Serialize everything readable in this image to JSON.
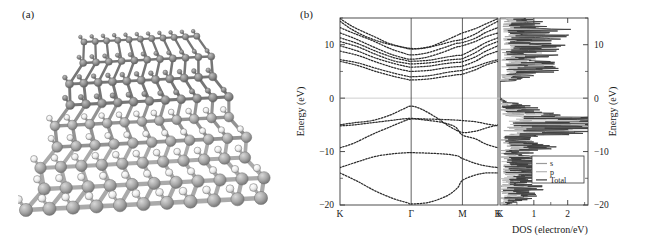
{
  "figure": {
    "panel_a_label": "(a)",
    "panel_b_label": "(b)",
    "panel_a_description": "ball-and-stick crystal lattice render"
  },
  "chart_data": {
    "type": "line",
    "title": "",
    "subtitle": "",
    "ylabel_left": "Energy (eV)",
    "ylabel_right": "Energy (eV)",
    "ylim": [
      -20,
      15
    ],
    "yticks": [
      10,
      0,
      -10,
      -20
    ],
    "ytick_labels": [
      "10",
      "0",
      "-10",
      "-20"
    ],
    "grid": false,
    "fermi_level": 0,
    "bandstructure": {
      "xlabel": "",
      "kpath_labels": [
        "K",
        "Γ",
        "M",
        "K"
      ],
      "kpath_positions": [
        0,
        1,
        1.72,
        2.22
      ],
      "series": [
        {
          "name": "cb1",
          "values": [
            [
              0,
              14.9
            ],
            [
              0.15,
              13.6
            ],
            [
              0.3,
              12.6
            ],
            [
              0.5,
              11.4
            ],
            [
              0.7,
              10.2
            ],
            [
              1.0,
              9.3
            ],
            [
              1.25,
              9.6
            ],
            [
              1.45,
              10.6
            ],
            [
              1.62,
              11.6
            ],
            [
              1.72,
              12.2
            ],
            [
              1.9,
              13.0
            ],
            [
              2.05,
              13.9
            ],
            [
              2.22,
              14.9
            ]
          ]
        },
        {
          "name": "cb2",
          "values": [
            [
              0,
              14.4
            ],
            [
              0.15,
              13.0
            ],
            [
              0.35,
              11.6
            ],
            [
              0.6,
              10.4
            ],
            [
              0.85,
              9.6
            ],
            [
              1.0,
              9.2
            ],
            [
              1.2,
              9.4
            ],
            [
              1.4,
              10.0
            ],
            [
              1.6,
              10.7
            ],
            [
              1.72,
              11.0
            ],
            [
              1.9,
              12.0
            ],
            [
              2.05,
              13.2
            ],
            [
              2.22,
              14.4
            ]
          ]
        },
        {
          "name": "cb3",
          "values": [
            [
              0,
              13.2
            ],
            [
              0.2,
              12.1
            ],
            [
              0.45,
              10.8
            ],
            [
              0.7,
              9.3
            ],
            [
              0.9,
              8.4
            ],
            [
              1.0,
              8.1
            ],
            [
              1.2,
              8.4
            ],
            [
              1.45,
              9.4
            ],
            [
              1.62,
              10.2
            ],
            [
              1.72,
              10.4
            ],
            [
              1.9,
              11.2
            ],
            [
              2.05,
              12.3
            ],
            [
              2.22,
              13.2
            ]
          ]
        },
        {
          "name": "cb4",
          "values": [
            [
              0,
              12.2
            ],
            [
              0.2,
              11.2
            ],
            [
              0.45,
              9.7
            ],
            [
              0.7,
              8.3
            ],
            [
              0.9,
              7.5
            ],
            [
              1.0,
              7.3
            ],
            [
              1.2,
              7.6
            ],
            [
              1.45,
              8.6
            ],
            [
              1.62,
              9.5
            ],
            [
              1.72,
              9.8
            ],
            [
              1.9,
              10.6
            ],
            [
              2.05,
              11.5
            ],
            [
              2.22,
              12.2
            ]
          ]
        },
        {
          "name": "cb5",
          "values": [
            [
              0,
              11.3
            ],
            [
              0.25,
              10.2
            ],
            [
              0.5,
              8.8
            ],
            [
              0.75,
              7.6
            ],
            [
              0.95,
              7.0
            ],
            [
              1.0,
              6.9
            ],
            [
              1.25,
              7.1
            ],
            [
              1.5,
              7.7
            ],
            [
              1.65,
              8.0
            ],
            [
              1.72,
              8.1
            ],
            [
              1.9,
              9.3
            ],
            [
              2.05,
              10.4
            ],
            [
              2.22,
              11.3
            ]
          ]
        },
        {
          "name": "cb6",
          "values": [
            [
              0,
              10.6
            ],
            [
              0.25,
              9.6
            ],
            [
              0.5,
              8.2
            ],
            [
              0.75,
              7.0
            ],
            [
              0.95,
              6.5
            ],
            [
              1.0,
              6.4
            ],
            [
              1.25,
              6.6
            ],
            [
              1.5,
              7.1
            ],
            [
              1.65,
              7.3
            ],
            [
              1.72,
              7.4
            ],
            [
              1.9,
              8.5
            ],
            [
              2.05,
              9.7
            ],
            [
              2.22,
              10.6
            ]
          ]
        },
        {
          "name": "cb7",
          "values": [
            [
              0,
              9.8
            ],
            [
              0.25,
              8.8
            ],
            [
              0.5,
              7.5
            ],
            [
              0.78,
              6.4
            ],
            [
              0.95,
              5.9
            ],
            [
              1.0,
              5.8
            ],
            [
              1.25,
              6.0
            ],
            [
              1.5,
              6.5
            ],
            [
              1.65,
              6.7
            ],
            [
              1.72,
              6.8
            ],
            [
              1.9,
              7.7
            ],
            [
              2.05,
              8.8
            ],
            [
              2.22,
              9.8
            ]
          ]
        },
        {
          "name": "cb8",
          "values": [
            [
              0,
              8.8
            ],
            [
              0.25,
              8.0
            ],
            [
              0.5,
              6.8
            ],
            [
              0.78,
              5.6
            ],
            [
              0.95,
              5.1
            ],
            [
              1.0,
              5.0
            ],
            [
              1.25,
              5.2
            ],
            [
              1.5,
              5.7
            ],
            [
              1.65,
              5.9
            ],
            [
              1.72,
              6.0
            ],
            [
              1.9,
              6.9
            ],
            [
              2.05,
              8.0
            ],
            [
              2.22,
              8.8
            ]
          ]
        },
        {
          "name": "cb9",
          "values": [
            [
              0,
              7.2
            ],
            [
              0.25,
              6.6
            ],
            [
              0.5,
              5.6
            ],
            [
              0.78,
              4.6
            ],
            [
              0.95,
              4.1
            ],
            [
              1.0,
              4.0
            ],
            [
              1.25,
              4.2
            ],
            [
              1.5,
              4.8
            ],
            [
              1.65,
              5.1
            ],
            [
              1.72,
              5.2
            ],
            [
              1.9,
              5.9
            ],
            [
              2.05,
              6.6
            ],
            [
              2.22,
              7.2
            ]
          ]
        },
        {
          "name": "cb10",
          "values": [
            [
              0,
              6.9
            ],
            [
              0.25,
              6.1
            ],
            [
              0.5,
              5.0
            ],
            [
              0.78,
              4.0
            ],
            [
              0.95,
              3.5
            ],
            [
              1.0,
              3.4
            ],
            [
              1.25,
              3.6
            ],
            [
              1.5,
              4.1
            ],
            [
              1.65,
              4.4
            ],
            [
              1.72,
              4.5
            ],
            [
              1.9,
              5.3
            ],
            [
              2.05,
              6.2
            ],
            [
              2.22,
              6.9
            ]
          ]
        },
        {
          "name": "vb1",
          "values": [
            [
              0,
              -5.0
            ],
            [
              0.2,
              -4.6
            ],
            [
              0.45,
              -4.2
            ],
            [
              0.7,
              -3.2
            ],
            [
              0.88,
              -2.1
            ],
            [
              1.0,
              -1.5
            ],
            [
              1.15,
              -2.1
            ],
            [
              1.35,
              -3.6
            ],
            [
              1.55,
              -5.4
            ],
            [
              1.72,
              -6.4
            ],
            [
              1.9,
              -6.2
            ],
            [
              2.05,
              -5.6
            ],
            [
              2.22,
              -5.0
            ]
          ]
        },
        {
          "name": "vb2",
          "values": [
            [
              0,
              -5.2
            ],
            [
              0.2,
              -5.0
            ],
            [
              0.45,
              -4.6
            ],
            [
              0.7,
              -4.2
            ],
            [
              0.88,
              -3.9
            ],
            [
              1.0,
              -3.8
            ],
            [
              1.2,
              -3.9
            ],
            [
              1.45,
              -4.0
            ],
            [
              1.62,
              -4.1
            ],
            [
              1.72,
              -4.2
            ],
            [
              1.9,
              -4.4
            ],
            [
              2.05,
              -4.8
            ],
            [
              2.22,
              -5.2
            ]
          ]
        },
        {
          "name": "vb3",
          "values": [
            [
              0,
              -9.3
            ],
            [
              0.2,
              -8.4
            ],
            [
              0.45,
              -6.8
            ],
            [
              0.7,
              -5.4
            ],
            [
              0.88,
              -4.4
            ],
            [
              1.0,
              -3.9
            ],
            [
              1.2,
              -4.1
            ],
            [
              1.45,
              -4.6
            ],
            [
              1.62,
              -5.4
            ],
            [
              1.72,
              -6.9
            ],
            [
              1.9,
              -7.6
            ],
            [
              2.05,
              -8.6
            ],
            [
              2.22,
              -9.3
            ]
          ]
        },
        {
          "name": "vb4",
          "values": [
            [
              0,
              -13.0
            ],
            [
              0.25,
              -11.9
            ],
            [
              0.5,
              -10.9
            ],
            [
              0.75,
              -10.4
            ],
            [
              0.95,
              -10.2
            ],
            [
              1.0,
              -10.2
            ],
            [
              1.25,
              -10.3
            ],
            [
              1.5,
              -10.5
            ],
            [
              1.65,
              -10.8
            ],
            [
              1.72,
              -11.3
            ],
            [
              1.9,
              -12.2
            ],
            [
              2.05,
              -12.7
            ],
            [
              2.22,
              -13.0
            ]
          ]
        },
        {
          "name": "vb5",
          "values": [
            [
              0,
              -14.0
            ],
            [
              0.25,
              -15.6
            ],
            [
              0.5,
              -17.4
            ],
            [
              0.75,
              -18.8
            ],
            [
              0.95,
              -19.6
            ],
            [
              1.0,
              -19.8
            ],
            [
              1.25,
              -19.5
            ],
            [
              1.5,
              -18.3
            ],
            [
              1.65,
              -16.8
            ],
            [
              1.72,
              -15.4
            ],
            [
              1.9,
              -14.4
            ],
            [
              2.05,
              -14.0
            ],
            [
              2.22,
              -14.0
            ]
          ]
        }
      ]
    },
    "dos": {
      "xlabel": "DOS (electron/eV)",
      "xlim": [
        0,
        2.6
      ],
      "xticks": [
        1,
        2
      ],
      "xtick_labels": [
        "1",
        "2"
      ],
      "origin_label": "K",
      "legend_position": "lower-right",
      "legend": [
        {
          "label": "s",
          "color": "#9a9a9a"
        },
        {
          "label": "p",
          "color": "#b5b5b5"
        },
        {
          "label": "Total",
          "color": "#3a3a3a"
        }
      ]
    }
  },
  "colors": {
    "axis": "#3a3a3a",
    "band_line": "#2b2b2b",
    "fermi": "#c8c8c8",
    "dos_total": "#3a3a3a",
    "dos_s": "#9e9e9e",
    "dos_p": "#bdbdbd",
    "atom_light": "#e8e8e8",
    "atom_dark": "#8d8d8d",
    "bond": "#9b9b9b"
  }
}
